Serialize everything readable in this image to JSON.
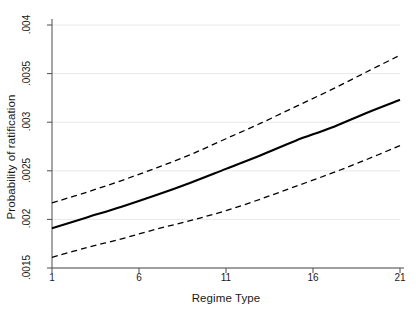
{
  "chart_data": {
    "type": "line",
    "title": "",
    "xlabel": "Regime Type",
    "ylabel": "Probability of ratification",
    "xlim": [
      1,
      21
    ],
    "ylim": [
      0.0015,
      0.004
    ],
    "grid": true,
    "legend": "none",
    "xticks": [
      1,
      6,
      11,
      16,
      21
    ],
    "xtick_labels": [
      "1",
      "6",
      "11",
      "16",
      "21"
    ],
    "yticks": [
      0.0015,
      0.002,
      0.0025,
      0.003,
      0.0035,
      0.004
    ],
    "ytick_labels": [
      ".0015",
      ".002",
      ".0025",
      ".003",
      ".0035",
      ".004"
    ],
    "x": [
      1,
      3,
      5,
      7,
      9,
      11,
      13,
      15,
      17,
      19,
      21
    ],
    "series": [
      {
        "name": "Predicted probability",
        "style": "solid",
        "color": "#000000",
        "values": [
          0.00191,
          0.00202,
          0.00213,
          0.00225,
          0.00238,
          0.00252,
          0.00266,
          0.00281,
          0.00294,
          0.00309,
          0.00323
        ]
      },
      {
        "name": "Upper 95% confidence bound",
        "style": "dashed",
        "color": "#000000",
        "values": [
          0.00217,
          0.00228,
          0.0024,
          0.00253,
          0.00267,
          0.00283,
          0.00299,
          0.00316,
          0.00333,
          0.00351,
          0.00369
        ]
      },
      {
        "name": "Lower 95% confidence bound",
        "style": "dashed",
        "color": "#000000",
        "values": [
          0.00161,
          0.00171,
          0.0018,
          0.0019,
          0.00199,
          0.00209,
          0.00221,
          0.00234,
          0.00247,
          0.00261,
          0.00276
        ]
      }
    ],
    "colors": {
      "axis": "#4d4d4d",
      "grid": "#e8e8e8",
      "line": "#000000",
      "background": "#ffffff"
    }
  }
}
